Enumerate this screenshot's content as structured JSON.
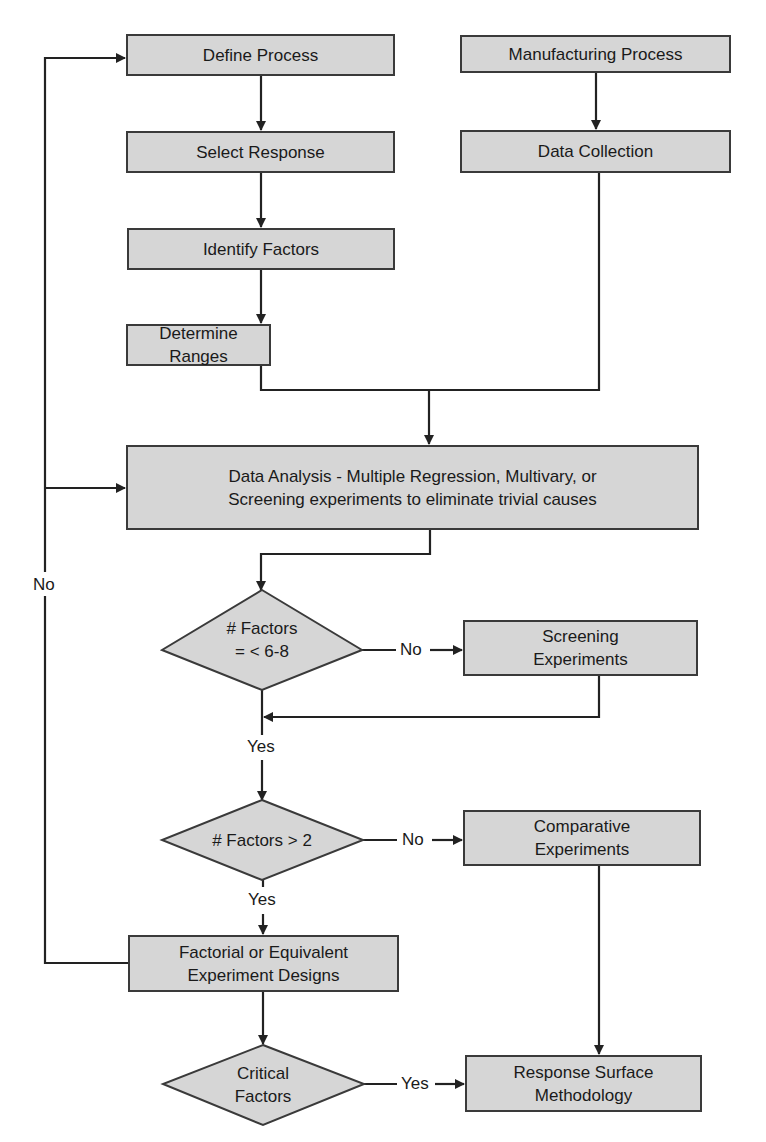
{
  "diagram": {
    "type": "flowchart",
    "colors": {
      "node_fill": "#d6d6d6",
      "stroke": "#222222",
      "background": "#ffffff"
    },
    "nodes": {
      "define_process": "Define Process",
      "select_response": "Select Response",
      "identify_factors": "Identify Factors",
      "determine_ranges": "Determine Ranges",
      "manufacturing_process": "Manufacturing Process",
      "data_collection": "Data Collection",
      "data_analysis": "Data Analysis - Multiple Regression, Multivary, or\nScreening experiments to eliminate trivial causes",
      "decision_factors_6_8": "# Factors\n= < 6-8",
      "screening_experiments": "Screening\nExperiments",
      "decision_factors_gt_2": "# Factors > 2",
      "comparative_experiments": "Comparative\nExperiments",
      "factorial_designs": "Factorial or Equivalent\nExperiment Designs",
      "decision_critical_factors": "Critical\nFactors",
      "response_surface": "Response Surface\nMethodology"
    },
    "edge_labels": {
      "loop_no": "No",
      "d1_no": "No",
      "d1_yes": "Yes",
      "d2_no": "No",
      "d2_yes": "Yes",
      "d3_yes": "Yes"
    },
    "edges": [
      {
        "from": "define_process",
        "to": "select_response"
      },
      {
        "from": "select_response",
        "to": "identify_factors"
      },
      {
        "from": "identify_factors",
        "to": "determine_ranges"
      },
      {
        "from": "manufacturing_process",
        "to": "data_collection"
      },
      {
        "from": "determine_ranges",
        "to": "data_analysis"
      },
      {
        "from": "data_collection",
        "to": "data_analysis"
      },
      {
        "from": "data_analysis",
        "to": "decision_factors_6_8"
      },
      {
        "from": "decision_factors_6_8",
        "to": "screening_experiments",
        "label": "No"
      },
      {
        "from": "screening_experiments",
        "to": "decision_factors_gt_2"
      },
      {
        "from": "decision_factors_6_8",
        "to": "decision_factors_gt_2",
        "label": "Yes"
      },
      {
        "from": "decision_factors_gt_2",
        "to": "comparative_experiments",
        "label": "No"
      },
      {
        "from": "decision_factors_gt_2",
        "to": "factorial_designs",
        "label": "Yes"
      },
      {
        "from": "comparative_experiments",
        "to": "response_surface"
      },
      {
        "from": "factorial_designs",
        "to": "decision_critical_factors"
      },
      {
        "from": "decision_critical_factors",
        "to": "response_surface",
        "label": "Yes"
      },
      {
        "from": "factorial_designs",
        "to": "define_process",
        "label": "No"
      },
      {
        "from": "factorial_designs",
        "to": "data_analysis",
        "label": "No"
      }
    ]
  }
}
